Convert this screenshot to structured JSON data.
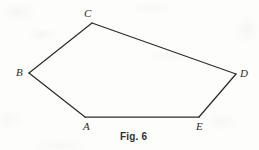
{
  "figure": {
    "caption": "Fig. 6",
    "shape_name": "pentagon-ABCDE",
    "stroke_color": "#2d2d2d",
    "background_color": "#fdfdfc",
    "label_color": "#2b2b2b",
    "canvas": {
      "width": 259,
      "height": 150
    },
    "vertices": [
      {
        "id": "A",
        "label": "A",
        "x": 85,
        "y": 117,
        "label_x": 83,
        "label_y": 121
      },
      {
        "id": "B",
        "label": "B",
        "x": 29,
        "y": 73,
        "label_x": 16,
        "label_y": 67
      },
      {
        "id": "C",
        "label": "C",
        "x": 92,
        "y": 23,
        "label_x": 84,
        "label_y": 8
      },
      {
        "id": "D",
        "label": "D",
        "x": 236,
        "y": 74,
        "label_x": 240,
        "label_y": 68
      },
      {
        "id": "E",
        "label": "E",
        "x": 199,
        "y": 117,
        "label_x": 196,
        "label_y": 121
      }
    ],
    "edges": [
      {
        "from": "A",
        "to": "B"
      },
      {
        "from": "B",
        "to": "C"
      },
      {
        "from": "C",
        "to": "D"
      },
      {
        "from": "D",
        "to": "E"
      },
      {
        "from": "E",
        "to": "A"
      }
    ],
    "polygon_points": "85,117 29,73 92,23 236,74 199,117",
    "caption_x": 120,
    "caption_y": 131
  }
}
